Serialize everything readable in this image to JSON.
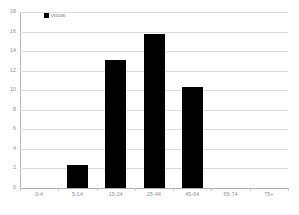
{
  "chart_data": {
    "type": "bar",
    "title": "",
    "xlabel": "",
    "ylabel": "",
    "categories": [
      "0-4",
      "5-14",
      "15-24",
      "25-44",
      "45-64",
      "65-74",
      "75+"
    ],
    "values": [
      0,
      2.4,
      13.1,
      15.8,
      10.3,
      0,
      0
    ],
    "series": [
      {
        "name": "vrouw",
        "values": [
          0,
          2.4,
          13.1,
          15.8,
          10.3,
          0,
          0
        ],
        "color": "#000000"
      }
    ],
    "ylim": [
      0,
      18
    ],
    "ytick_step": 2,
    "yticks": [
      "0",
      "2",
      "4",
      "6",
      "8",
      "10",
      "12",
      "14",
      "16",
      "18"
    ],
    "grid": true,
    "grid_axis": "y",
    "legend": {
      "position": "top-left",
      "entries": [
        {
          "label": "vrouw",
          "color": "#000000"
        }
      ]
    }
  },
  "colors": {
    "background": "#ffffff",
    "bar": "#000000",
    "gridline": "#dcdcdc",
    "axis": "#b8b8b8",
    "tick_text": "#8a8a8a"
  }
}
